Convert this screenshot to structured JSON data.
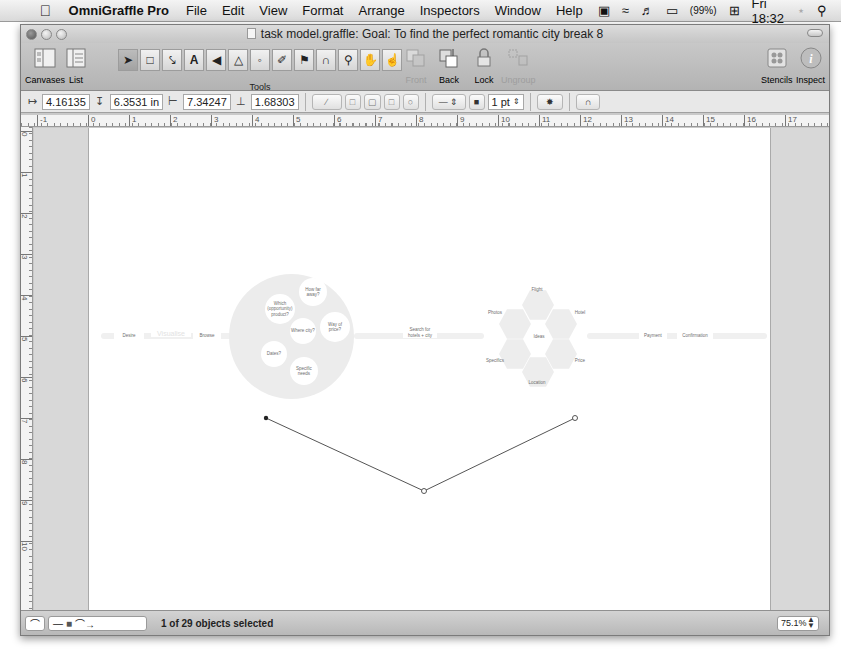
{
  "menubar": {
    "apple_icon": "apple-icon",
    "app_name": "OmniGraffle Pro",
    "menus": [
      "File",
      "Edit",
      "View",
      "Format",
      "Arrange",
      "Inspectors",
      "Window",
      "Help"
    ],
    "status": {
      "battery": "(99%)",
      "clock": "Fri 18:32"
    }
  },
  "window": {
    "title": "task model.graffle: Goal: To find the perfect romantic city break 8"
  },
  "toolbar": {
    "canvases_label": "Canvases",
    "list_label": "List",
    "tools_label": "Tools",
    "front_label": "Front",
    "back_label": "Back",
    "lock_label": "Lock",
    "ungroup_label": "Ungroup",
    "stencils_label": "Stencils",
    "inspect_label": "Inspect"
  },
  "formatbar": {
    "x": "4.16135",
    "y": "6.3531 in",
    "width": "7.34247",
    "height": "1.68303",
    "stroke_width": "1 pt"
  },
  "rulers": {
    "horizontal": [
      "-1",
      "0",
      "1",
      "2",
      "3",
      "4",
      "5",
      "6",
      "7",
      "8",
      "9",
      "10",
      "11",
      "12",
      "13",
      "14",
      "15",
      "16",
      "17"
    ],
    "vertical": [
      "0",
      "1",
      "2",
      "3",
      "4",
      "5",
      "6",
      "7",
      "8",
      "9",
      "10"
    ]
  },
  "diagram": {
    "left_chain": {
      "desire": "Desire",
      "faint_mid": "Visualise",
      "browse": "Browse"
    },
    "cluster_left": {
      "how_far": "How far away?",
      "which_product": "Which (opportunity) product?",
      "where_city": "Where city?",
      "way_of_price": "Way of price?",
      "dates": "Dates?",
      "specific_needs": "Specific needs"
    },
    "search_node": "Search for hotels + city",
    "cluster_right": {
      "flight": "Flight",
      "photos": "Photos",
      "hotel": "Hotel",
      "ideas": "Ideas",
      "specifics": "Specifics",
      "price": "Price",
      "location": "Location"
    },
    "right_chain": {
      "payment": "Payment",
      "confirmation": "Confirmation"
    }
  },
  "statusbar": {
    "selection": "1 of 29 objects selected",
    "zoom": "75.1%"
  }
}
